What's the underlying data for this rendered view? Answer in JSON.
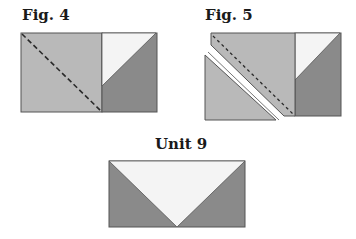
{
  "figures": [
    {
      "id": "fig4",
      "label": "Fig. 4"
    },
    {
      "id": "fig5",
      "label": "Fig. 5"
    },
    {
      "id": "unit9",
      "label": "Unit 9"
    }
  ],
  "colors": {
    "light_fabric": "#b9b9b9",
    "dark_fabric": "#8a8a8a",
    "white_fabric": "#f4f4f4",
    "outline": "#555555",
    "seam_line": "#2a2a2a"
  }
}
